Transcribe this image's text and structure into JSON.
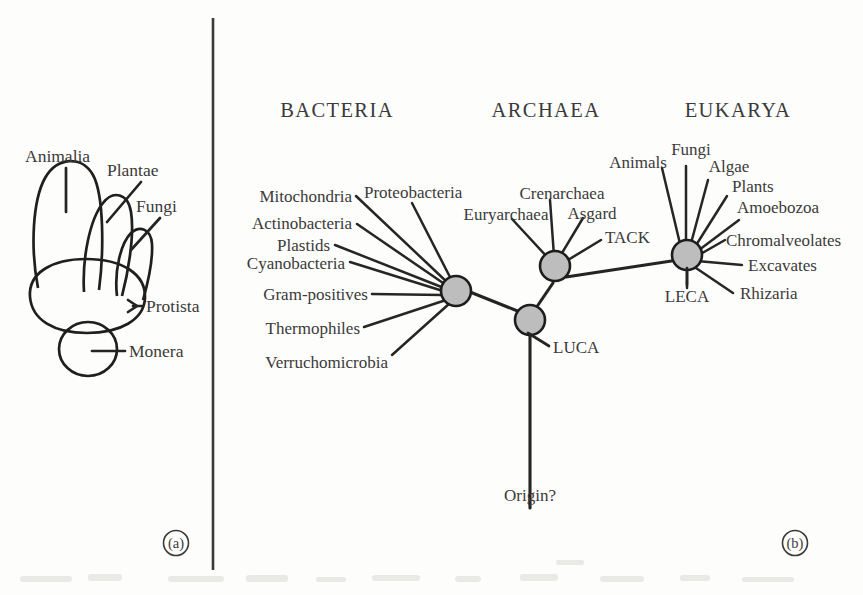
{
  "figure": {
    "panels": [
      {
        "id": "a",
        "letter": "(a)",
        "name": "five-kingdom-diagram",
        "labels": [
          {
            "key": "animalia",
            "text": "Animalia"
          },
          {
            "key": "plantae",
            "text": "Plantae"
          },
          {
            "key": "fungi",
            "text": "Fungi"
          },
          {
            "key": "protista",
            "text": "Protista"
          },
          {
            "key": "monera",
            "text": "Monera"
          }
        ]
      },
      {
        "id": "b",
        "letter": "(b)",
        "name": "three-domain-tree",
        "domains": [
          {
            "key": "bacteria",
            "text": "BACTERIA"
          },
          {
            "key": "archaea",
            "text": "ARCHAEA"
          },
          {
            "key": "eukarya",
            "text": "EUKARYA"
          }
        ],
        "nodes": [
          {
            "key": "luca",
            "text": "LUCA"
          },
          {
            "key": "leca",
            "text": "LECA"
          },
          {
            "key": "origin",
            "text": "Origin?"
          }
        ],
        "bacteria_tips": [
          {
            "key": "mitochondria",
            "text": "Mitochondria"
          },
          {
            "key": "proteobacteria",
            "text": "Proteobacteria"
          },
          {
            "key": "actinobacteria",
            "text": "Actinobacteria"
          },
          {
            "key": "plastids",
            "text": "Plastids"
          },
          {
            "key": "cyanobacteria",
            "text": "Cyanobacteria"
          },
          {
            "key": "gram_positives",
            "text": "Gram-positives"
          },
          {
            "key": "thermophiles",
            "text": "Thermophiles"
          },
          {
            "key": "verruchomicrobia",
            "text": "Verruchomicrobia"
          }
        ],
        "archaea_tips": [
          {
            "key": "crenarchaea",
            "text": "Crenarchaea"
          },
          {
            "key": "euryarchaea",
            "text": "Euryarchaea"
          },
          {
            "key": "asgard",
            "text": "Asgard"
          },
          {
            "key": "tack",
            "text": "TACK"
          }
        ],
        "eukarya_tips": [
          {
            "key": "animals",
            "text": "Animals"
          },
          {
            "key": "fungi",
            "text": "Fungi"
          },
          {
            "key": "algae",
            "text": "Algae"
          },
          {
            "key": "plants",
            "text": "Plants"
          },
          {
            "key": "amoebozoa",
            "text": "Amoebozoa"
          },
          {
            "key": "chromalveolates",
            "text": "Chromalveolates"
          },
          {
            "key": "excavates",
            "text": "Excavates"
          },
          {
            "key": "rhizaria",
            "text": "Rhizaria"
          }
        ]
      }
    ],
    "colors": {
      "ink": "#242424",
      "text": "#3a3a3a",
      "node_fill": "#bdbdbd",
      "background": "#fdfdfb"
    }
  }
}
